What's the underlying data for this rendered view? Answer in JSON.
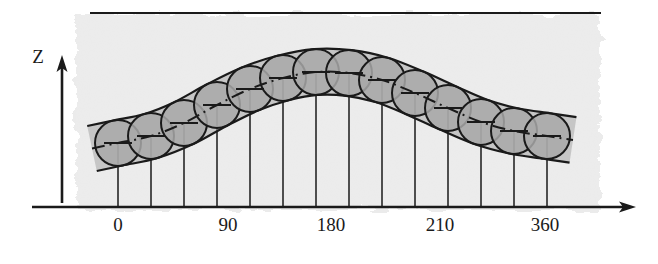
{
  "figure": {
    "background_color": "#ffffff",
    "paper_texture_color": "#ebebeb",
    "ink_color": "#1a1a1a",
    "sphere_fill_color": "#a8a8a8",
    "sphere_stroke_color": "#1a1a1a"
  },
  "axes": {
    "vertical": {
      "label": "Z",
      "label_x": 38,
      "label_y": 63,
      "x": 62,
      "y_bottom": 203,
      "y_top": 58,
      "has_arrow": true
    },
    "horizontal": {
      "label": "",
      "y": 207,
      "x_start": 32,
      "x_end": 636,
      "has_arrow": true,
      "tick_labels": [
        {
          "text": "0",
          "x": 118,
          "y": 231
        },
        {
          "text": "90",
          "x": 228,
          "y": 231
        },
        {
          "text": "180",
          "x": 331,
          "y": 231
        },
        {
          "text": "210",
          "x": 440,
          "y": 231
        },
        {
          "text": "360",
          "x": 545,
          "y": 231
        }
      ]
    }
  },
  "top_rule": {
    "name": "upper-boundary-line",
    "x_start": 90,
    "x_end": 601,
    "y": 13
  },
  "texture_region": {
    "x": 76,
    "y": 14,
    "width": 524,
    "height": 196
  },
  "band": {
    "half_thickness": 23,
    "centerline_style": "dash-dot",
    "upper_edge_note": "envelope above sphere centers",
    "lower_edge_note": "envelope below sphere centers"
  },
  "chart_data": {
    "type": "line",
    "xlabel": "",
    "ylabel": "Z",
    "xlim": [
      -30,
      400
    ],
    "ylim": [
      0,
      200
    ],
    "grid": false,
    "legend": "none",
    "x_tick_values": [
      0,
      90,
      180,
      210,
      360
    ],
    "x_tick_labels": [
      "0",
      "90",
      "180",
      "210",
      "360"
    ],
    "series": [
      {
        "name": "tube centerline",
        "style": "dash-dot",
        "x": [
          0,
          28,
          56,
          84,
          112,
          140,
          168,
          196,
          224,
          252,
          280,
          308,
          336,
          364
        ],
        "y": [
          57,
          64,
          77,
          95,
          113,
          128,
          138,
          140,
          136,
          126,
          113,
          100,
          91,
          87
        ]
      }
    ],
    "spheres": [
      {
        "index": 1,
        "x_deg": 0,
        "cx": 118,
        "cy": 143,
        "r": 23
      },
      {
        "index": 2,
        "x_deg": 28,
        "cx": 151,
        "cy": 136,
        "r": 23
      },
      {
        "index": 3,
        "x_deg": 56,
        "cx": 184,
        "cy": 123,
        "r": 23
      },
      {
        "index": 4,
        "x_deg": 84,
        "cx": 217,
        "cy": 105,
        "r": 23
      },
      {
        "index": 5,
        "x_deg": 112,
        "cx": 250,
        "cy": 89,
        "r": 23
      },
      {
        "index": 6,
        "x_deg": 140,
        "cx": 283,
        "cy": 78,
        "r": 23
      },
      {
        "index": 7,
        "x_deg": 168,
        "cx": 316,
        "cy": 72,
        "r": 23
      },
      {
        "index": 8,
        "x_deg": 196,
        "cx": 349,
        "cy": 73,
        "r": 23
      },
      {
        "index": 9,
        "x_deg": 224,
        "cx": 382,
        "cy": 80,
        "r": 23
      },
      {
        "index": 10,
        "x_deg": 252,
        "cx": 415,
        "cy": 93,
        "r": 23
      },
      {
        "index": 11,
        "x_deg": 280,
        "cx": 448,
        "cy": 108,
        "r": 23
      },
      {
        "index": 12,
        "x_deg": 308,
        "cx": 481,
        "cy": 122,
        "r": 23
      },
      {
        "index": 13,
        "x_deg": 336,
        "cx": 514,
        "cy": 131,
        "r": 23
      },
      {
        "index": 14,
        "x_deg": 364,
        "cx": 547,
        "cy": 136,
        "r": 23
      }
    ],
    "drop_lines": {
      "note": "vertical line from each sphere center down to the horizontal axis",
      "baseline_y": 207
    },
    "center_markers": {
      "note": "small horizontal tick at each sphere center forming a perpendicular symbol",
      "half_width": 14
    }
  }
}
